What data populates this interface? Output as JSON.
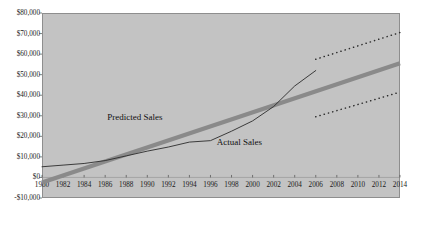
{
  "chart_data": {
    "type": "line",
    "title": "",
    "xlabel": "",
    "ylabel": "",
    "xlim": [
      1980,
      2014
    ],
    "ylim": [
      -10000,
      80000
    ],
    "grid": false,
    "legend_position": "inline-annotations",
    "y_ticks": [
      {
        "value": 80000,
        "label": "$80,000"
      },
      {
        "value": 70000,
        "label": "$70,000"
      },
      {
        "value": 60000,
        "label": "$60,000"
      },
      {
        "value": 50000,
        "label": "$50,000"
      },
      {
        "value": 40000,
        "label": "$40,000"
      },
      {
        "value": 30000,
        "label": "$30,000"
      },
      {
        "value": 20000,
        "label": "$20,000"
      },
      {
        "value": 10000,
        "label": "$10,000"
      },
      {
        "value": 0,
        "label": "$0"
      },
      {
        "value": -10000,
        "label": "-$10,000"
      }
    ],
    "x_ticks": [
      {
        "value": 1980,
        "label": "1980"
      },
      {
        "value": 1982,
        "label": "1982"
      },
      {
        "value": 1984,
        "label": "1984"
      },
      {
        "value": 1986,
        "label": "1986"
      },
      {
        "value": 1988,
        "label": "1988"
      },
      {
        "value": 1990,
        "label": "1990"
      },
      {
        "value": 1992,
        "label": "1992"
      },
      {
        "value": 1994,
        "label": "1994"
      },
      {
        "value": 1996,
        "label": "1996"
      },
      {
        "value": 1998,
        "label": "1998"
      },
      {
        "value": 2000,
        "label": "2000"
      },
      {
        "value": 2002,
        "label": "2002"
      },
      {
        "value": 2004,
        "label": "2004"
      },
      {
        "value": 2006,
        "label": "2006"
      },
      {
        "value": 2008,
        "label": "2008"
      },
      {
        "value": 2010,
        "label": "2010"
      },
      {
        "value": 2012,
        "label": "2012"
      },
      {
        "value": 2014,
        "label": "2014"
      }
    ],
    "series": [
      {
        "name": "Predicted Sales",
        "style": "thick-solid",
        "color": "#8a8a8a",
        "annotation": "Predicted Sales",
        "x": [
          1980,
          2014
        ],
        "values": [
          -2500,
          55500
        ]
      },
      {
        "name": "Actual Sales",
        "style": "thin-solid",
        "color": "#2b2b2b",
        "annotation": "Actual Sales",
        "x": [
          1980,
          1982,
          1984,
          1986,
          1988,
          1990,
          1992,
          1994,
          1996,
          1998,
          2000,
          2002,
          2004,
          2006
        ],
        "values": [
          5200,
          6000,
          6800,
          8200,
          10500,
          12800,
          14800,
          17200,
          17900,
          22500,
          27500,
          34500,
          44500,
          52000
        ]
      },
      {
        "name": "Upper Confidence Band",
        "style": "dotted",
        "color": "#2b2b2b",
        "x": [
          2006,
          2014
        ],
        "values": [
          57500,
          70500
        ]
      },
      {
        "name": "Lower Confidence Band",
        "style": "dotted",
        "color": "#2b2b2b",
        "x": [
          2006,
          2014
        ],
        "values": [
          29500,
          41500
        ]
      }
    ]
  }
}
